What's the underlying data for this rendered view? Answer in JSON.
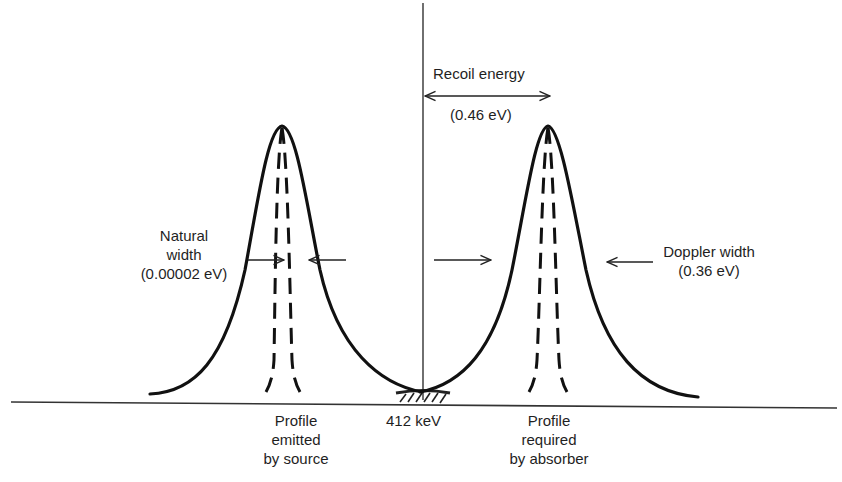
{
  "diagram": {
    "title": "",
    "recoil": {
      "label": "Recoil energy",
      "value": "(0.46 eV)"
    },
    "natural_width": {
      "line1": "Natural",
      "line2": "width",
      "line3": "(0.00002 eV)"
    },
    "doppler_width": {
      "line1": "Doppler width",
      "line2": "(0.36 eV)"
    },
    "center_energy": "412 keV",
    "source_profile": {
      "line1": "Profile",
      "line2": "emitted",
      "line3": "by source"
    },
    "absorber_profile": {
      "line1": "Profile",
      "line2": "required",
      "line3": "by absorber"
    },
    "colors": {
      "ink": "#111111",
      "background": "#ffffff"
    }
  }
}
